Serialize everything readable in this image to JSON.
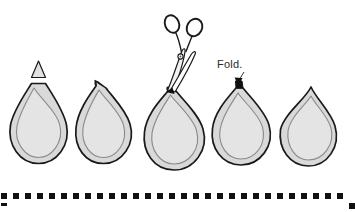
{
  "figure": {
    "type": "craft-instruction-diagram",
    "title": "",
    "annotations": {
      "fold_label": "Fold."
    },
    "palette": {
      "background": "#ffffff",
      "shape_fill": "#d9d9d9",
      "shape_inner_fill": "#e4e4e4",
      "outline": "#1a1a1a",
      "inner_outline": "#8a8a8a",
      "ink": "#2b2b2b",
      "dot": "#111111"
    },
    "steps": [
      {
        "index": 1,
        "name": "teardrop-with-triangle-tab",
        "marker": "triangle",
        "description": "Teardrop shape with flat top and small outlined triangle above"
      },
      {
        "index": 2,
        "name": "teardrop-tilted-point",
        "marker": "point",
        "description": "Teardrop tilted with small pointed tab at upper left"
      },
      {
        "index": 3,
        "name": "teardrop-being-cut",
        "marker": "scissors",
        "description": "Teardrop with scissors cutting the top point"
      },
      {
        "index": 4,
        "name": "teardrop-folded",
        "marker": "arrow",
        "description": "Teardrop with arrow pointing to folded top, labeled Fold."
      },
      {
        "index": 5,
        "name": "teardrop-finished",
        "marker": "none",
        "description": "Finished teardrop with sharp point at top"
      }
    ],
    "tools": [
      {
        "name": "scissors",
        "description": "Open scissors angled down-left, blades at the third shape's tip",
        "handles": 2
      }
    ],
    "border": {
      "name": "dotted-border-strip",
      "style": "square-dots",
      "dot_size_px": 6,
      "dot_spacing_px": 12,
      "dot_count": 29,
      "extra_dots": 2
    }
  }
}
